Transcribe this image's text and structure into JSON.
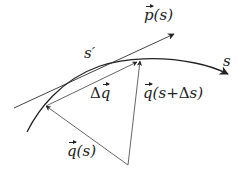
{
  "diagram": {
    "labels": {
      "p_of_s": {
        "vec": "p",
        "arg": "(s)"
      },
      "s_prime": "s′",
      "s": "s",
      "delta_q": {
        "delta": "Δ",
        "vec": "q"
      },
      "q_s_plus_ds": {
        "vec": "q",
        "arg_open": "(s+",
        "delta": "Δ",
        "arg_close": "s)"
      },
      "q_of_s": {
        "vec": "q",
        "arg": "(s)"
      }
    },
    "colors": {
      "stroke": "#222222",
      "thin_stroke": "#555555",
      "background": "#ffffff"
    }
  }
}
